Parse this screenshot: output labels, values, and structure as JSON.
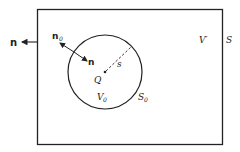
{
  "diagram": {
    "outer_region": {
      "volume_label": "V′",
      "surface_label": "S"
    },
    "inner_sphere": {
      "volume_label": "V",
      "volume_sub": "0",
      "surface_label": "S",
      "surface_sub": "0",
      "center_label": "Q",
      "radius_label": "s"
    },
    "normals": {
      "outer_normal": "n",
      "inner_normal_out": "n",
      "inner_normal_out_sub": "0",
      "inner_normal_in": "n"
    },
    "colors": {
      "stroke": "#222222",
      "background": "#ffffff"
    }
  }
}
